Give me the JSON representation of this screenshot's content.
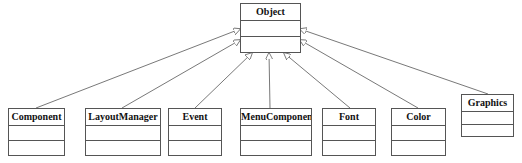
{
  "diagram": {
    "type": "uml-class-hierarchy",
    "relationship": "generalization",
    "parent": {
      "name": "Object"
    },
    "children": [
      {
        "name": "Component"
      },
      {
        "name": "LayoutManager"
      },
      {
        "name": "Event"
      },
      {
        "name": "MenuComponent"
      },
      {
        "name": "Font"
      },
      {
        "name": "Color"
      },
      {
        "name": "Graphics"
      }
    ]
  },
  "colors": {
    "line": "#555555",
    "text": "#111111",
    "background": "#ffffff"
  }
}
